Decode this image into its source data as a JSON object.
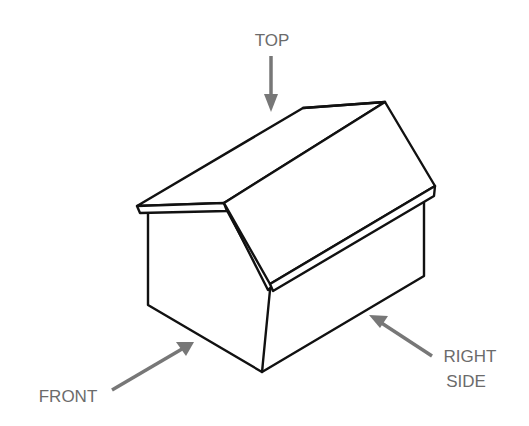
{
  "diagram": {
    "labels": {
      "top": "TOP",
      "front": "FRONT",
      "right_side_line1": "RIGHT",
      "right_side_line2": "SIDE"
    },
    "colors": {
      "line": "#111111",
      "arrow": "#777777",
      "label": "#6b6b6b",
      "background": "#ffffff"
    }
  }
}
